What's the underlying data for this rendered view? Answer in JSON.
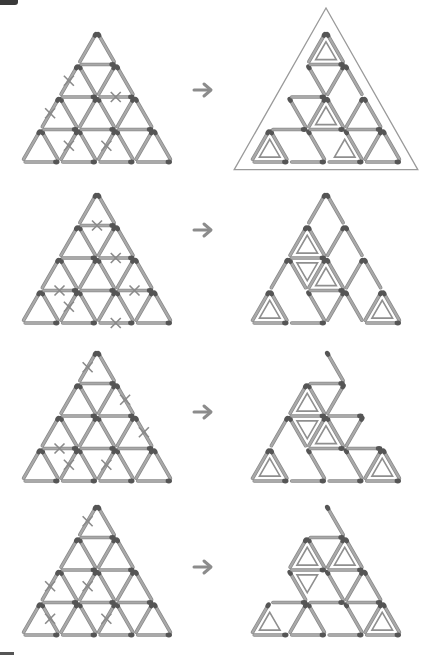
{
  "colors": {
    "match_stick": "#a9a9a9",
    "match_edge": "#8a8a8a",
    "match_head": "#555555",
    "cross": "#8a8a8a",
    "arrow": "#8c8c8c",
    "frame": "#9a9a9a",
    "inner_triangle": "#8f8f8f",
    "corner_tab": "#3a3a3a"
  },
  "layout": {
    "unit": 37.5,
    "row_height": 32.5
  },
  "icons": {
    "arrow": "right-arrow-icon",
    "cross": "x-mark-icon"
  },
  "puzzles": [
    {
      "name": "puzzle-1",
      "arrow": {
        "x": 194,
        "y": 90
      },
      "left": {
        "apex": [
          97,
          32
        ],
        "removed": [
          "L:1:0",
          "H:2:1",
          "L:2:0",
          "H:3:3",
          "L:3:1",
          "L:3:2"
        ]
      },
      "right": {
        "apex": [
          326,
          32
        ],
        "frame": true,
        "inner": [
          [
            0,
            0,
            "up"
          ],
          [
            2,
            1,
            "up"
          ],
          [
            3,
            0,
            "up"
          ],
          [
            3,
            2,
            "up"
          ]
        ]
      }
    },
    {
      "name": "puzzle-2",
      "arrow": {
        "x": 194,
        "y": 230
      },
      "left": {
        "apex": [
          97,
          193
        ],
        "removed": [
          "H:1:0",
          "H:2:1",
          "H:3:0",
          "H:3:2",
          "L:3:1",
          "H:4:2"
        ]
      },
      "right": {
        "apex": [
          326,
          193
        ],
        "frame": false,
        "inner": [
          [
            1,
            0,
            "up"
          ],
          [
            1,
            0,
            "down"
          ],
          [
            2,
            1,
            "up"
          ],
          [
            3,
            0,
            "up"
          ],
          [
            3,
            3,
            "up"
          ]
        ]
      }
    },
    {
      "name": "puzzle-3",
      "arrow": {
        "x": 194,
        "y": 412
      },
      "left": {
        "apex": [
          97,
          351
        ],
        "removed": [
          "L:0:0",
          "R:1:1",
          "R:2:2",
          "H:3:0",
          "L:3:1",
          "L:3:2"
        ]
      },
      "right": {
        "apex": [
          326,
          351
        ],
        "frame": false,
        "inner": [
          [
            1,
            0,
            "up"
          ],
          [
            1,
            0,
            "down"
          ],
          [
            2,
            1,
            "up"
          ],
          [
            3,
            0,
            "up"
          ],
          [
            3,
            3,
            "up"
          ]
        ]
      }
    },
    {
      "name": "puzzle-4",
      "arrow": {
        "x": 194,
        "y": 567
      },
      "left": {
        "apex": [
          97,
          505
        ],
        "removed": [
          "L:0:0",
          "L:2:0",
          "L:2:1",
          "H:3:3",
          "R:3:0",
          "L:3:2"
        ]
      },
      "right": {
        "apex": [
          326,
          505
        ],
        "frame": false,
        "inner": [
          [
            1,
            0,
            "up"
          ],
          [
            1,
            0,
            "down"
          ],
          [
            1,
            1,
            "up"
          ],
          [
            3,
            0,
            "up"
          ],
          [
            3,
            3,
            "up"
          ]
        ]
      }
    }
  ]
}
